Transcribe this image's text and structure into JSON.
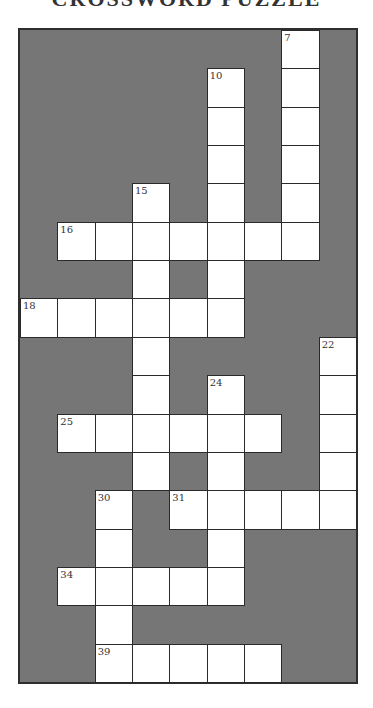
{
  "title": "CROSSWORD PUZZLE",
  "grid": {
    "rows": 17,
    "cols": 9,
    "colors": {
      "block": "#767676",
      "cell": "#ffffff",
      "border": "#2a2a2a"
    },
    "white_cells": [
      [
        0,
        7
      ],
      [
        1,
        5
      ],
      [
        1,
        7
      ],
      [
        2,
        5
      ],
      [
        2,
        7
      ],
      [
        3,
        5
      ],
      [
        3,
        7
      ],
      [
        4,
        3
      ],
      [
        4,
        5
      ],
      [
        4,
        7
      ],
      [
        5,
        1
      ],
      [
        5,
        2
      ],
      [
        5,
        3
      ],
      [
        5,
        4
      ],
      [
        5,
        5
      ],
      [
        5,
        6
      ],
      [
        5,
        7
      ],
      [
        6,
        3
      ],
      [
        6,
        5
      ],
      [
        7,
        0
      ],
      [
        7,
        1
      ],
      [
        7,
        2
      ],
      [
        7,
        3
      ],
      [
        7,
        4
      ],
      [
        7,
        5
      ],
      [
        8,
        3
      ],
      [
        8,
        8
      ],
      [
        9,
        3
      ],
      [
        9,
        5
      ],
      [
        9,
        8
      ],
      [
        10,
        1
      ],
      [
        10,
        2
      ],
      [
        10,
        3
      ],
      [
        10,
        4
      ],
      [
        10,
        5
      ],
      [
        10,
        6
      ],
      [
        10,
        8
      ],
      [
        11,
        3
      ],
      [
        11,
        5
      ],
      [
        11,
        8
      ],
      [
        12,
        2
      ],
      [
        12,
        4
      ],
      [
        12,
        5
      ],
      [
        12,
        6
      ],
      [
        12,
        7
      ],
      [
        12,
        8
      ],
      [
        13,
        2
      ],
      [
        13,
        5
      ],
      [
        14,
        1
      ],
      [
        14,
        2
      ],
      [
        14,
        3
      ],
      [
        14,
        4
      ],
      [
        14,
        5
      ],
      [
        15,
        2
      ],
      [
        16,
        2
      ],
      [
        16,
        3
      ],
      [
        16,
        4
      ],
      [
        16,
        5
      ],
      [
        16,
        6
      ]
    ],
    "numbers": [
      {
        "row": 0,
        "col": 7,
        "label": "7"
      },
      {
        "row": 1,
        "col": 5,
        "label": "10"
      },
      {
        "row": 4,
        "col": 3,
        "label": "15"
      },
      {
        "row": 5,
        "col": 1,
        "label": "16"
      },
      {
        "row": 7,
        "col": 0,
        "label": "18"
      },
      {
        "row": 8,
        "col": 8,
        "label": "22"
      },
      {
        "row": 9,
        "col": 5,
        "label": "24"
      },
      {
        "row": 10,
        "col": 1,
        "label": "25"
      },
      {
        "row": 12,
        "col": 2,
        "label": "30"
      },
      {
        "row": 12,
        "col": 4,
        "label": "31"
      },
      {
        "row": 14,
        "col": 1,
        "label": "34"
      },
      {
        "row": 16,
        "col": 2,
        "label": "39"
      }
    ]
  }
}
